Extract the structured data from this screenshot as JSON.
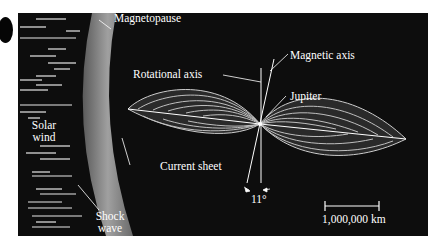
{
  "diagram": {
    "labels": {
      "magnetopause": "Magnetopause",
      "rotational_axis": "Rotational axis",
      "magnetic_axis": "Magnetic axis",
      "jupiter": "Jupiter",
      "solar_wind_line1": "Solar",
      "solar_wind_line2": "wind",
      "current_sheet": "Current sheet",
      "angle": "11°",
      "shock_wave_line1": "Shock",
      "shock_wave_line2": "wave",
      "scale_bar": "1,000,000 km"
    },
    "colors": {
      "background": "#0d0d0d",
      "band": "#8a8a8a",
      "text": "#ffffff"
    }
  }
}
